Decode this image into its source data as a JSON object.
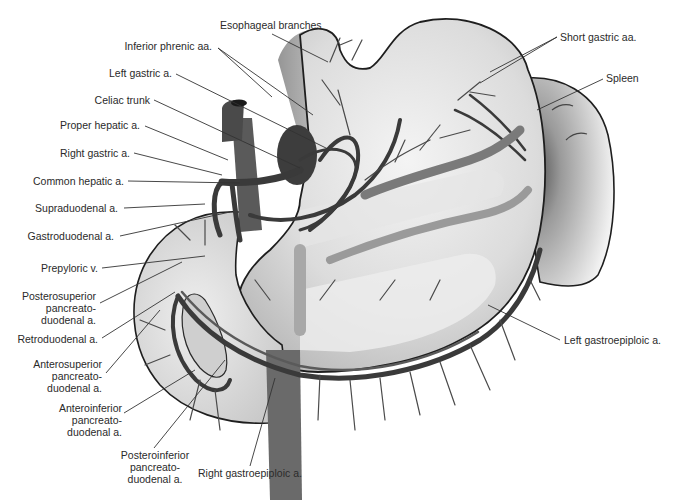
{
  "figure": {
    "palette": {
      "organ_fill": "#d9d9d9",
      "organ_light": "#efefef",
      "vessel_dark": "#3a3a3a",
      "vessel_mid": "#5a5a5a",
      "outline": "#1e1e1e",
      "label_text": "#2a2a2a",
      "leader_line": "#333333",
      "spleen_shadow": "#6d6d6d"
    }
  },
  "labels": {
    "esophageal_branches": "Esophageal branches",
    "inferior_phrenic": "Inferior phrenic aa.",
    "left_gastric": "Left gastric a.",
    "celiac_trunk": "Celiac trunk",
    "proper_hepatic": "Proper hepatic a.",
    "right_gastric": "Right gastric a.",
    "common_hepatic": "Common hepatic a.",
    "supraduodenal": "Supraduodenal a.",
    "gastroduodenal": "Gastroduodenal a.",
    "prepyloric": "Prepyloric v.",
    "posterosuperior": [
      "Posterosuperior",
      "pancreato-",
      "duodenal a."
    ],
    "retroduodenal": "Retroduodenal a.",
    "anterosuperior": [
      "Anterosuperior",
      "pancreato-",
      "duodenal a."
    ],
    "anteroinferior": [
      "Anteroinferior",
      "pancreato-",
      "duodenal a."
    ],
    "posteroinferior": [
      "Posteroinferior",
      "pancreato-",
      "duodenal a."
    ],
    "right_gastroepiploic": "Right gastroepiploic a.",
    "left_gastroepiploic": "Left gastroepiploic a.",
    "short_gastric": "Short gastric aa.",
    "spleen": "Spleen"
  }
}
